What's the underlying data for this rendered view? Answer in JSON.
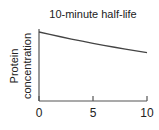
{
  "chart_data": {
    "type": "line",
    "title": "10-minute half-life",
    "xlabel": "",
    "ylabel": "Protein concentration",
    "ylabel_lines": [
      "Protein",
      "concentration"
    ],
    "x_ticks": [
      0,
      5,
      10
    ],
    "x_tick_labels": [
      "0",
      "5",
      "10"
    ],
    "xlim": [
      0,
      10
    ],
    "ylim": [
      0,
      1.0
    ],
    "y_ticks": [],
    "grid": false,
    "legend": null,
    "series": [
      {
        "name": "Protein concentration",
        "x": [
          0,
          1,
          2,
          3,
          4,
          5,
          6,
          7,
          8,
          9,
          10
        ],
        "values": [
          1.0,
          0.965,
          0.931,
          0.898,
          0.867,
          0.836,
          0.807,
          0.779,
          0.751,
          0.725,
          0.7
        ],
        "color": "#444444"
      }
    ]
  },
  "style": {
    "axis_color": "#555555",
    "line_color": "#444444"
  }
}
